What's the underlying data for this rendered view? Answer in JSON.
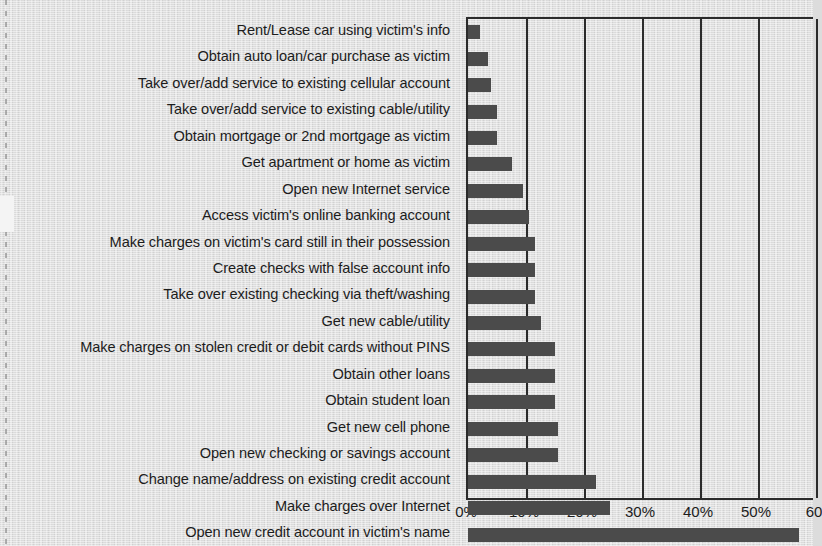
{
  "chart_data": {
    "type": "bar",
    "orientation": "horizontal",
    "title": "",
    "xlabel": "",
    "ylabel": "",
    "xlim": [
      0,
      60
    ],
    "grid": true,
    "legend": false,
    "xticks": [
      "0%",
      "10%",
      "20%",
      "30%",
      "40%",
      "50%",
      "60"
    ],
    "xtick_values": [
      0,
      10,
      20,
      30,
      40,
      50,
      60
    ],
    "categories": [
      "Rent/Lease car using victim's info",
      "Obtain auto loan/car purchase as victim",
      "Take over/add service to existing cellular account",
      "Take over/add service to existing cable/utility",
      "Obtain mortgage or 2nd mortgage as victim",
      "Get apartment or home as victim",
      "Open new Internet service",
      "Access victim's online banking account",
      "Make charges on victim's card still in their possession",
      "Create checks with false account info",
      "Take over existing checking via theft/washing",
      "Get new cable/utility",
      "Make charges on stolen credit or debit cards without PINS",
      "Obtain other loans",
      "Obtain student loan",
      "Get new cell phone",
      "Open new checking or savings account",
      "Change name/address on existing credit account",
      "Make charges over Internet",
      "Open new credit account in victim's name"
    ],
    "values": [
      2,
      3.5,
      4,
      5,
      5,
      7.5,
      9.5,
      10.5,
      11.5,
      11.5,
      11.5,
      12.5,
      15,
      15,
      15,
      15.5,
      15.5,
      22,
      24.5,
      57
    ],
    "bar_color": "#4f4f4f",
    "background_color": "#dcdcdc",
    "axis_color": "#2b2b2b"
  },
  "axis": {
    "tick_0": "0%",
    "tick_10": "10%",
    "tick_20": "20%",
    "tick_30": "30%",
    "tick_40": "40%",
    "tick_50": "50%",
    "tick_60": "60"
  }
}
